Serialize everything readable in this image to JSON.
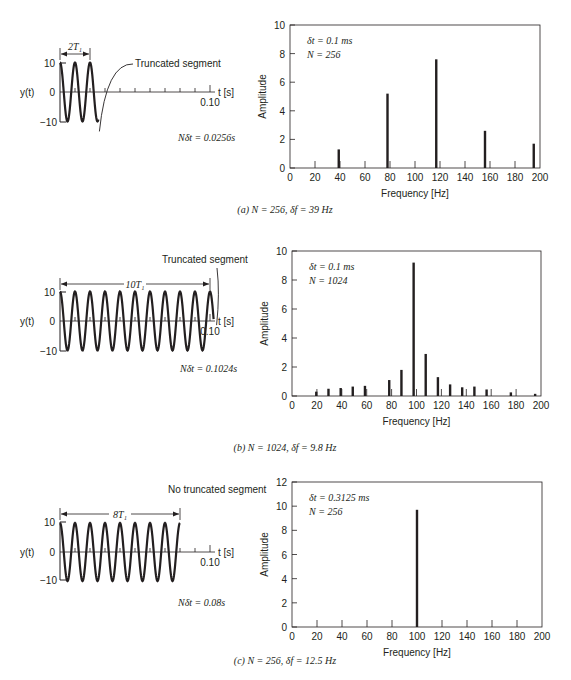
{
  "panels": [
    {
      "id": "a",
      "caption": "(a) N = 256, δf = 39 Hz",
      "time_plot": {
        "ylabel": "y(t)",
        "yticks": [
          "10",
          "0",
          "−10"
        ],
        "xlabel": "t [s]",
        "xtick_end": "0.10",
        "period_label": "2T₁",
        "segment_note": "Truncated segment",
        "record_length": "Nδt = 0.0256s",
        "record_seconds": 0.0256
      },
      "annotation_dt": "δt = 0.1 ms",
      "annotation_N": "N = 256"
    },
    {
      "id": "b",
      "caption": "(b) N = 1024, δf = 9.8 Hz",
      "time_plot": {
        "ylabel": "y(t)",
        "yticks": [
          "10",
          "0",
          "−10"
        ],
        "xlabel": "t [s]",
        "xtick_end": "0.10",
        "period_label": "10T₁",
        "segment_note": "Truncated segment",
        "record_length": "Nδt = 0.1024s",
        "record_seconds": 0.1024
      },
      "annotation_dt": "δt = 0.1 ms",
      "annotation_N": "N = 1024"
    },
    {
      "id": "c",
      "caption": "(c) N = 256, δf = 12.5 Hz",
      "time_plot": {
        "ylabel": "y(t)",
        "yticks": [
          "10",
          "0",
          "−10"
        ],
        "xlabel": "t [s]",
        "xtick_end": "0.10",
        "period_label": "8T₁",
        "segment_note": "No truncated segment",
        "record_length": "Nδt = 0.08s",
        "record_seconds": 0.08
      },
      "annotation_dt": "δt = 0.3125 ms",
      "annotation_N": "N = 256"
    }
  ],
  "chart_data": [
    {
      "type": "bar",
      "title": "(a) N = 256, δf = 39 Hz",
      "xlabel": "Frequency [Hz]",
      "ylabel": "Amplitude",
      "xlim": [
        0,
        200
      ],
      "ylim": [
        0,
        10
      ],
      "xticks": [
        0,
        20,
        40,
        60,
        80,
        100,
        120,
        140,
        160,
        180,
        200
      ],
      "yticks": [
        0,
        2,
        4,
        6,
        8,
        10
      ],
      "annotations": [
        "δt = 0.1 ms",
        "N = 256"
      ],
      "x": [
        39,
        78,
        117,
        156,
        195
      ],
      "values": [
        1.3,
        5.2,
        7.6,
        2.6,
        1.7
      ],
      "grid": false
    },
    {
      "type": "bar",
      "title": "(b) N = 1024, δf = 9.8 Hz",
      "xlabel": "Frequency [Hz]",
      "ylabel": "Amplitude",
      "xlim": [
        0,
        200
      ],
      "ylim": [
        0,
        10
      ],
      "xticks": [
        0,
        20,
        40,
        60,
        80,
        100,
        120,
        140,
        160,
        180,
        200
      ],
      "yticks": [
        0,
        2,
        4,
        6,
        8,
        10
      ],
      "annotations": [
        "δt = 0.1 ms",
        "N = 1024"
      ],
      "x": [
        19.5,
        29.3,
        39.1,
        48.8,
        58.6,
        78.1,
        87.9,
        97.7,
        107.4,
        117.2,
        127.0,
        136.7,
        146.5,
        156.3,
        175.8,
        195.3
      ],
      "values": [
        0.3,
        0.5,
        0.55,
        0.65,
        0.7,
        1.1,
        1.8,
        9.2,
        2.9,
        1.3,
        0.8,
        0.6,
        0.65,
        0.45,
        0.25,
        0.15
      ],
      "grid": false
    },
    {
      "type": "bar",
      "title": "(c) N = 256, δf = 12.5 Hz",
      "xlabel": "Frequency [Hz]",
      "ylabel": "Amplitude",
      "xlim": [
        0,
        200
      ],
      "ylim": [
        0,
        12
      ],
      "xticks": [
        0,
        20,
        40,
        60,
        80,
        100,
        120,
        140,
        160,
        180,
        200
      ],
      "yticks": [
        0,
        2,
        4,
        6,
        8,
        10,
        12
      ],
      "annotations": [
        "δt = 0.3125 ms",
        "N = 256"
      ],
      "x": [
        100
      ],
      "values": [
        9.7
      ],
      "grid": false
    }
  ]
}
